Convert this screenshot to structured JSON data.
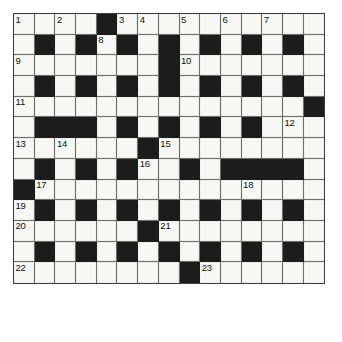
{
  "puzzle": {
    "kind": "crossword-grid",
    "title": "Crossword Puzzle Grid",
    "columns": 15,
    "rows": 13,
    "cell_size_px": 20.7,
    "colors": {
      "block": "#1c1c1c",
      "cell": "#f7f7f5",
      "grid_line": "#6e6e6e",
      "border": "#3d3d3d",
      "number_text": "#111111",
      "page_background": "#ffffff"
    },
    "highest_clue_number": 23,
    "clue_numbers": [
      1,
      2,
      3,
      4,
      5,
      6,
      7,
      8,
      9,
      10,
      11,
      12,
      13,
      14,
      15,
      16,
      17,
      18,
      19,
      20,
      21,
      22,
      23
    ],
    "grid": [
      [
        "1",
        "w",
        "2",
        "w",
        "#",
        "3",
        "4",
        "w",
        "5",
        "w",
        "6",
        "w",
        "7",
        "w",
        "w"
      ],
      [
        "w",
        "#",
        "w",
        "#",
        "8",
        "#",
        "w",
        "#",
        "w",
        "#",
        "w",
        "#",
        "w",
        "#",
        "w"
      ],
      [
        "9",
        "w",
        "w",
        "w",
        "w",
        "w",
        "w",
        "#",
        "10",
        "w",
        "w",
        "w",
        "w",
        "w",
        "w"
      ],
      [
        "w",
        "#",
        "w",
        "#",
        "w",
        "#",
        "w",
        "#",
        "w",
        "#",
        "w",
        "#",
        "w",
        "#",
        "w"
      ],
      [
        "11",
        "w",
        "w",
        "w",
        "w",
        "w",
        "w",
        "w",
        "w",
        "w",
        "w",
        "w",
        "w",
        "w",
        "#"
      ],
      [
        "w",
        "#",
        "#",
        "#",
        "w",
        "#",
        "w",
        "#",
        "w",
        "#",
        "w",
        "#",
        "w",
        "12",
        "w"
      ],
      [
        "13",
        "w",
        "14",
        "w",
        "w",
        "w",
        "#",
        "15",
        "w",
        "w",
        "w",
        "w",
        "w",
        "w",
        "w"
      ],
      [
        "w",
        "#",
        "w",
        "#",
        "w",
        "#",
        "16",
        "w",
        "#",
        "w",
        "#",
        "#",
        "#",
        "#",
        "w"
      ],
      [
        "#",
        "17",
        "w",
        "w",
        "w",
        "w",
        "w",
        "w",
        "w",
        "w",
        "w",
        "18",
        "w",
        "w",
        "w"
      ],
      [
        "19",
        "#",
        "w",
        "#",
        "w",
        "#",
        "w",
        "#",
        "w",
        "#",
        "w",
        "#",
        "w",
        "#",
        "w"
      ],
      [
        "20",
        "w",
        "w",
        "w",
        "w",
        "w",
        "#",
        "21",
        "w",
        "w",
        "w",
        "w",
        "w",
        "w",
        "w"
      ],
      [
        "w",
        "#",
        "w",
        "#",
        "w",
        "#",
        "w",
        "#",
        "w",
        "#",
        "w",
        "#",
        "w",
        "#",
        "w"
      ],
      [
        "22",
        "w",
        "w",
        "w",
        "w",
        "w",
        "w",
        "w",
        "#",
        "23",
        "w",
        "w",
        "w",
        "w",
        "w"
      ]
    ],
    "legend": {
      "block_token": "#",
      "white_token": "w",
      "numbered_token": "integer string means numbered white cell"
    }
  }
}
